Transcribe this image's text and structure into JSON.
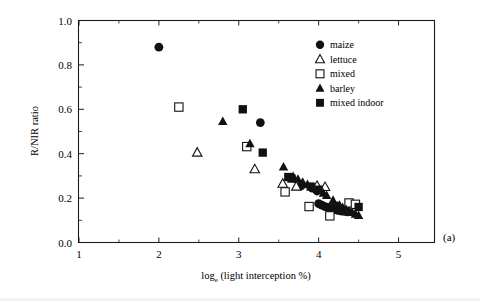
{
  "figure": {
    "panel_label": "(a)",
    "background_color": "#ffffff",
    "marker_color": "#111111"
  },
  "chart_data": {
    "type": "scatter",
    "title": "",
    "xlabel": "log_e (light interception %)",
    "xlabel_main": "log",
    "xlabel_subscript": "e",
    "xlabel_rest": " (light interception %)",
    "ylabel": "R/NIR ratio",
    "xlim": [
      1,
      5.45
    ],
    "ylim": [
      0.0,
      1.0
    ],
    "xticks": [
      1,
      2,
      3,
      4,
      5
    ],
    "xtick_labels": [
      "1",
      "2",
      "3",
      "4",
      "5"
    ],
    "x_minor_ticks": [
      1.5,
      2.5,
      3.5,
      4.5
    ],
    "yticks": [
      0.0,
      0.2,
      0.4,
      0.6,
      0.8,
      1.0
    ],
    "ytick_labels": [
      "0.0",
      "0.2",
      "0.4",
      "0.6",
      "0.8",
      "1.0"
    ],
    "y_minor_ticks": [
      0.1,
      0.3,
      0.5,
      0.7,
      0.9
    ],
    "grid": false,
    "legend_position": "upper right",
    "series": [
      {
        "name": "maize",
        "marker": "filled-circle",
        "points": [
          [
            2.0,
            0.88
          ],
          [
            3.27,
            0.54
          ],
          [
            3.78,
            0.255
          ],
          [
            3.92,
            0.245
          ],
          [
            3.98,
            0.232
          ],
          [
            4.0,
            0.175
          ],
          [
            4.04,
            0.168
          ],
          [
            4.08,
            0.162
          ],
          [
            4.12,
            0.158
          ],
          [
            4.16,
            0.152
          ],
          [
            4.2,
            0.148
          ],
          [
            4.24,
            0.145
          ],
          [
            4.28,
            0.142
          ],
          [
            4.32,
            0.14
          ],
          [
            4.36,
            0.138
          ]
        ]
      },
      {
        "name": "lettuce",
        "marker": "open-triangle",
        "points": [
          [
            2.48,
            0.405
          ],
          [
            3.2,
            0.33
          ],
          [
            3.55,
            0.265
          ],
          [
            3.72,
            0.252
          ],
          [
            3.98,
            0.255
          ],
          [
            4.08,
            0.25
          ]
        ]
      },
      {
        "name": "mixed",
        "marker": "open-square",
        "points": [
          [
            2.25,
            0.61
          ],
          [
            3.1,
            0.432
          ],
          [
            3.58,
            0.228
          ],
          [
            3.88,
            0.162
          ],
          [
            4.14,
            0.12
          ],
          [
            4.38,
            0.178
          ],
          [
            4.46,
            0.172
          ]
        ]
      },
      {
        "name": "barley",
        "marker": "filled-triangle",
        "points": [
          [
            2.8,
            0.545
          ],
          [
            3.14,
            0.445
          ],
          [
            3.56,
            0.34
          ],
          [
            3.68,
            0.298
          ],
          [
            3.74,
            0.285
          ],
          [
            3.8,
            0.272
          ],
          [
            3.86,
            0.262
          ],
          [
            4.06,
            0.222
          ],
          [
            4.1,
            0.212
          ],
          [
            4.18,
            0.19
          ],
          [
            4.26,
            0.168
          ],
          [
            4.3,
            0.158
          ],
          [
            4.34,
            0.15
          ],
          [
            4.38,
            0.142
          ],
          [
            4.42,
            0.135
          ],
          [
            4.46,
            0.128
          ],
          [
            4.5,
            0.122
          ]
        ]
      },
      {
        "name": "mixed indoor",
        "marker": "filled-square",
        "points": [
          [
            3.05,
            0.6
          ],
          [
            3.3,
            0.405
          ],
          [
            3.62,
            0.295
          ],
          [
            3.66,
            0.288
          ],
          [
            3.9,
            0.252
          ],
          [
            4.0,
            0.238
          ],
          [
            4.22,
            0.165
          ],
          [
            4.5,
            0.16
          ]
        ]
      }
    ]
  },
  "legend": {
    "items": [
      {
        "label": "maize",
        "marker": "filled-circle"
      },
      {
        "label": "lettuce",
        "marker": "open-triangle"
      },
      {
        "label": "mixed",
        "marker": "open-square"
      },
      {
        "label": "barley",
        "marker": "filled-triangle"
      },
      {
        "label": "mixed indoor",
        "marker": "filled-square"
      }
    ]
  }
}
